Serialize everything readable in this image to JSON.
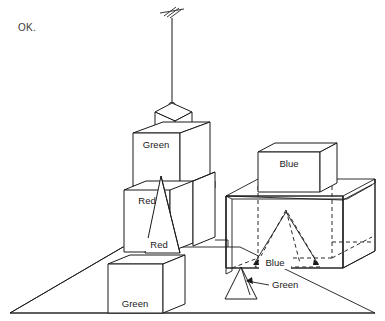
{
  "status": {
    "message": "OK."
  },
  "scene": {
    "title": "blocks-world-scene",
    "ground": {
      "label": "ground-plane"
    },
    "manipulator": {
      "label": "robot-gripper-arm",
      "holding": "Red"
    },
    "objects": [
      {
        "id": "obj-red-cube-top",
        "label": "Red",
        "shape": "cube",
        "color_name": "Red",
        "style": "solid"
      },
      {
        "id": "obj-green-cube-mid",
        "label": "Green",
        "shape": "cube",
        "color_name": "Green",
        "style": "solid"
      },
      {
        "id": "obj-red-block-left",
        "label": "Red",
        "shape": "block",
        "color_name": "Red",
        "style": "solid"
      },
      {
        "id": "obj-red-cone-tall",
        "label": "Red",
        "shape": "cone",
        "color_name": "Red",
        "style": "solid"
      },
      {
        "id": "obj-green-block-low",
        "label": "Green",
        "shape": "block",
        "color_name": "Green",
        "style": "solid"
      },
      {
        "id": "obj-blue-box",
        "label": "Blue",
        "shape": "box",
        "color_name": "Blue",
        "style": "solid"
      },
      {
        "id": "obj-blue-pyramid",
        "label": "Blue",
        "shape": "pyramid",
        "color_name": "Blue",
        "style": "dashed"
      },
      {
        "id": "obj-green-cone",
        "label": "Green",
        "shape": "cone",
        "color_name": "Green",
        "style": "solid"
      }
    ],
    "container": {
      "label": "open-box-container"
    }
  },
  "footer": {
    "caption": ""
  },
  "colors": {
    "background": "#ffffff",
    "line": "#1a1a1a",
    "dashed_line": "#2b2b2b",
    "text": "#1a1a1a",
    "status_text": "#3a3a3a"
  }
}
